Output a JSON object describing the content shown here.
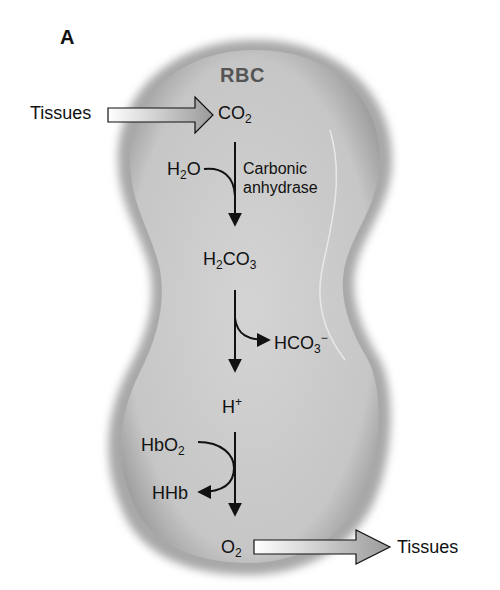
{
  "panel": {
    "label": "A"
  },
  "cell": {
    "label": "RBC",
    "fill": "#c8c8c8",
    "edge": "#9a9a9a"
  },
  "inflow": {
    "source": "Tissues",
    "product": "CO",
    "product_sub": "2"
  },
  "step1": {
    "reactant": "H",
    "reactant_sub": "2",
    "reactant_tail": "O",
    "enzyme_line1": "Carbonic",
    "enzyme_line2": "anhydrase"
  },
  "intermediate": {
    "a": "H",
    "a_sub": "2",
    "b": "CO",
    "b_sub": "3"
  },
  "step2": {
    "product": "HCO",
    "product_sub": "3",
    "product_sup": "−"
  },
  "proton": {
    "text": "H",
    "sup": "+"
  },
  "step3": {
    "reactant": "HbO",
    "reactant_sub": "2",
    "product": "HHb"
  },
  "outflow": {
    "product": "O",
    "product_sub": "2",
    "destination": "Tissues"
  }
}
